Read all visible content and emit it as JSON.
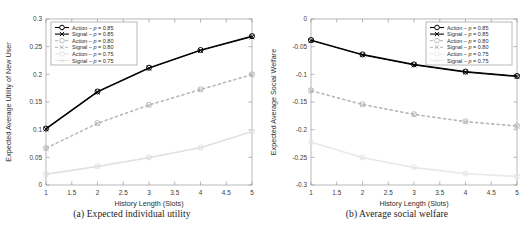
{
  "figure": {
    "panels": [
      {
        "id": "a",
        "caption": "(a)  Expected individual utility",
        "chart_data": {
          "type": "line",
          "title": "",
          "xlabel": "History Length (Slots)",
          "ylabel": "Expected Average Utility of New User",
          "x": [
            1,
            2,
            3,
            4,
            5
          ],
          "xlim": [
            1,
            5
          ],
          "ylim": [
            0,
            0.3
          ],
          "xticks": [
            1,
            1.5,
            2,
            2.5,
            3,
            3.5,
            4,
            4.5,
            5
          ],
          "xticklabels": [
            "1",
            "1.5",
            "2",
            "2.5",
            "3",
            "3.5",
            "4",
            "4.5",
            "5"
          ],
          "yticks": [
            0,
            0.05,
            0.1,
            0.15,
            0.2,
            0.25,
            0.3
          ],
          "yticklabels": [
            "0",
            "0.05",
            "0.1",
            "0.15",
            "0.2",
            "0.25",
            "0.3"
          ],
          "grid": false,
          "legend_position": "upper left",
          "series": [
            {
              "name": "Action – p = 0.85",
              "values": [
                0.102,
                0.169,
                0.212,
                0.244,
                0.269
              ],
              "color": "#000000",
              "style": "solid",
              "marker": "circle"
            },
            {
              "name": "Signal – p = 0.85",
              "values": [
                0.101,
                0.168,
                0.211,
                0.243,
                0.268
              ],
              "color": "#000000",
              "style": "solid",
              "marker": "x"
            },
            {
              "name": "Action – p = 0.80",
              "values": [
                0.067,
                0.112,
                0.145,
                0.173,
                0.2
              ],
              "color": "#b4b4b4",
              "style": "dashed",
              "marker": "circle"
            },
            {
              "name": "Signal – p = 0.80",
              "values": [
                0.066,
                0.111,
                0.144,
                0.172,
                0.199
              ],
              "color": "#b4b4b4",
              "style": "dashed",
              "marker": "x"
            },
            {
              "name": "Action – p = 0.75",
              "values": [
                0.02,
                0.034,
                0.05,
                0.068,
                0.097
              ],
              "color": "#e0e0e0",
              "style": "solid",
              "marker": "circle"
            },
            {
              "name": "Signal – p = 0.75",
              "values": [
                0.019,
                0.033,
                0.049,
                0.067,
                0.096
              ],
              "color": "#e0e0e0",
              "style": "solid",
              "marker": "x"
            }
          ]
        }
      },
      {
        "id": "b",
        "caption": "(b)  Average social welfare",
        "chart_data": {
          "type": "line",
          "title": "",
          "xlabel": "History Length (Slots)",
          "ylabel": "Expected Average Social Welfare",
          "x": [
            1,
            2,
            3,
            4,
            5
          ],
          "xlim": [
            1,
            5
          ],
          "ylim": [
            -0.3,
            0
          ],
          "xticks": [
            1,
            1.5,
            2,
            2.5,
            3,
            3.5,
            4,
            4.5,
            5
          ],
          "xticklabels": [
            "1",
            "1.5",
            "2",
            "2.5",
            "3",
            "3.5",
            "4",
            "4.5",
            "5"
          ],
          "yticks": [
            0,
            -0.05,
            -0.1,
            -0.15,
            -0.2,
            -0.25,
            -0.3
          ],
          "yticklabels": [
            "0",
            "-0.05",
            "-0.1",
            "-0.15",
            "-0.2",
            "-0.25",
            "-0.3"
          ],
          "grid": false,
          "legend_position": "upper right",
          "series": [
            {
              "name": "Action – p = 0.85",
              "values": [
                -0.038,
                -0.064,
                -0.082,
                -0.095,
                -0.103
              ],
              "color": "#000000",
              "style": "solid",
              "marker": "circle"
            },
            {
              "name": "Signal – p = 0.85",
              "values": [
                -0.039,
                -0.065,
                -0.083,
                -0.096,
                -0.104
              ],
              "color": "#000000",
              "style": "solid",
              "marker": "x"
            },
            {
              "name": "Action – p = 0.80",
              "values": [
                -0.129,
                -0.154,
                -0.172,
                -0.185,
                -0.193
              ],
              "color": "#b4b4b4",
              "style": "dashed",
              "marker": "circle"
            },
            {
              "name": "Signal – p = 0.80",
              "values": [
                -0.13,
                -0.155,
                -0.173,
                -0.186,
                -0.194
              ],
              "color": "#b4b4b4",
              "style": "dashed",
              "marker": "x"
            },
            {
              "name": "Action – p = 0.75",
              "values": [
                -0.222,
                -0.25,
                -0.268,
                -0.279,
                -0.284
              ],
              "color": "#e8e8e8",
              "style": "solid",
              "marker": "circle"
            },
            {
              "name": "Signal – p = 0.75",
              "values": [
                -0.223,
                -0.251,
                -0.269,
                -0.28,
                -0.285
              ],
              "color": "#e8e8e8",
              "style": "solid",
              "marker": "x"
            }
          ]
        }
      }
    ]
  }
}
